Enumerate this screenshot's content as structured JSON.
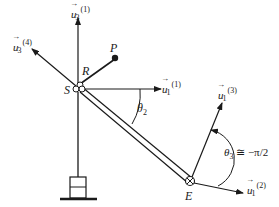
{
  "diagram": {
    "points": {
      "S": "S",
      "R": "R",
      "P": "P",
      "E": "E"
    },
    "vectors": [
      {
        "id": "u3_1",
        "base": "u",
        "sub": "3",
        "sup": "(1)"
      },
      {
        "id": "u3_4",
        "base": "u",
        "sub": "3",
        "sup": "(4)"
      },
      {
        "id": "u1_1",
        "base": "u",
        "sub": "1",
        "sup": "(1)"
      },
      {
        "id": "u1_3",
        "base": "u",
        "sub": "1",
        "sup": "(3)"
      },
      {
        "id": "u1_2",
        "base": "u",
        "sub": "1",
        "sup": "(2)"
      }
    ],
    "angles": {
      "theta2": "θ",
      "theta2_sub": "2",
      "theta3": "θ",
      "theta3_sub": "3",
      "theta3_value": " ≅ −π/2"
    },
    "colors": {
      "ink": "#1a1a1a",
      "background": "#ffffff"
    }
  }
}
